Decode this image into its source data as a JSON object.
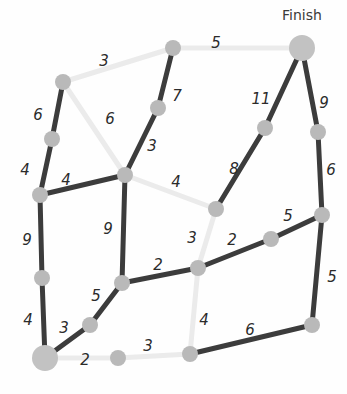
{
  "canvas": {
    "width": 347,
    "height": 394,
    "background": "#fefefe"
  },
  "style": {
    "dark_edge_color": "#3c3c3c",
    "light_edge_color": "#ebebeb",
    "node_color": "#b9b9b9",
    "terminal_node_color": "#c2c2c2",
    "label_color": "#2b2b2b",
    "edge_width": 5,
    "node_radius": 8,
    "terminal_node_radius": 13
  },
  "labels": {
    "finish": "Finish"
  },
  "chart_data": {
    "type": "diagram",
    "nodes": [
      {
        "id": "A",
        "x": 63,
        "y": 82,
        "r": 8,
        "kind": "normal"
      },
      {
        "id": "B",
        "x": 52,
        "y": 139,
        "r": 8,
        "kind": "normal"
      },
      {
        "id": "C",
        "x": 40,
        "y": 195,
        "r": 8,
        "kind": "normal"
      },
      {
        "id": "D",
        "x": 42,
        "y": 278,
        "r": 8,
        "kind": "normal"
      },
      {
        "id": "E",
        "x": 45,
        "y": 358,
        "r": 13,
        "kind": "terminal",
        "label": "Start"
      },
      {
        "id": "F",
        "x": 90,
        "y": 325,
        "r": 8,
        "kind": "normal"
      },
      {
        "id": "G",
        "x": 122,
        "y": 283,
        "r": 8,
        "kind": "normal"
      },
      {
        "id": "H",
        "x": 125,
        "y": 175,
        "r": 8,
        "kind": "normal"
      },
      {
        "id": "I",
        "x": 158,
        "y": 108,
        "r": 8,
        "kind": "normal"
      },
      {
        "id": "J",
        "x": 173,
        "y": 48,
        "r": 8,
        "kind": "normal"
      },
      {
        "id": "K",
        "x": 302,
        "y": 48,
        "r": 13,
        "kind": "terminal",
        "label": "Finish"
      },
      {
        "id": "L",
        "x": 265,
        "y": 128,
        "r": 8,
        "kind": "normal"
      },
      {
        "id": "M",
        "x": 318,
        "y": 132,
        "r": 8,
        "kind": "normal"
      },
      {
        "id": "N",
        "x": 322,
        "y": 215,
        "r": 8,
        "kind": "normal"
      },
      {
        "id": "O",
        "x": 271,
        "y": 239,
        "r": 8,
        "kind": "normal"
      },
      {
        "id": "P",
        "x": 216,
        "y": 209,
        "r": 8,
        "kind": "normal"
      },
      {
        "id": "Q",
        "x": 198,
        "y": 268,
        "r": 8,
        "kind": "normal"
      },
      {
        "id": "R",
        "x": 190,
        "y": 354,
        "r": 8,
        "kind": "normal"
      },
      {
        "id": "S",
        "x": 312,
        "y": 325,
        "r": 8,
        "kind": "normal"
      },
      {
        "id": "T",
        "x": 118,
        "y": 358,
        "r": 8,
        "kind": "normal"
      }
    ],
    "edges": [
      {
        "from": "A",
        "to": "J",
        "weight": "3",
        "highlighted": true,
        "label_x": 104,
        "label_y": 61
      },
      {
        "from": "J",
        "to": "K",
        "weight": "5",
        "highlighted": true,
        "label_x": 216,
        "label_y": 43
      },
      {
        "from": "A",
        "to": "B",
        "weight": "6",
        "highlighted": false,
        "label_x": 38,
        "label_y": 115
      },
      {
        "from": "A",
        "to": "H",
        "weight": "6",
        "highlighted": true,
        "label_x": 110,
        "label_y": 119
      },
      {
        "from": "B",
        "to": "C",
        "weight": "4",
        "highlighted": false,
        "label_x": 25,
        "label_y": 170
      },
      {
        "from": "J",
        "to": "I",
        "weight": "7",
        "highlighted": false,
        "label_x": 177,
        "label_y": 96
      },
      {
        "from": "I",
        "to": "H",
        "weight": "3",
        "highlighted": false,
        "label_x": 152,
        "label_y": 146
      },
      {
        "from": "C",
        "to": "H",
        "weight": "4",
        "highlighted": false,
        "label_x": 66,
        "label_y": 180
      },
      {
        "from": "H",
        "to": "P",
        "weight": "4",
        "highlighted": true,
        "label_x": 176,
        "label_y": 182
      },
      {
        "from": "C",
        "to": "D",
        "weight": "9",
        "highlighted": false,
        "label_x": 27,
        "label_y": 240
      },
      {
        "from": "H",
        "to": "G",
        "weight": "9",
        "highlighted": false,
        "label_x": 108,
        "label_y": 229
      },
      {
        "from": "K",
        "to": "L",
        "weight": "11",
        "highlighted": false,
        "label_x": 261,
        "label_y": 99
      },
      {
        "from": "K",
        "to": "M",
        "weight": "9",
        "highlighted": false,
        "label_x": 324,
        "label_y": 103
      },
      {
        "from": "L",
        "to": "P",
        "weight": "8",
        "highlighted": false,
        "label_x": 234,
        "label_y": 169
      },
      {
        "from": "M",
        "to": "N",
        "weight": "6",
        "highlighted": false,
        "label_x": 331,
        "label_y": 170
      },
      {
        "from": "N",
        "to": "O",
        "weight": "5",
        "highlighted": false,
        "label_x": 288,
        "label_y": 216
      },
      {
        "from": "O",
        "to": "Q",
        "weight": "2",
        "highlighted": false,
        "label_x": 232,
        "label_y": 240
      },
      {
        "from": "P",
        "to": "Q",
        "weight": "3",
        "highlighted": true,
        "label_x": 192,
        "label_y": 238
      },
      {
        "from": "G",
        "to": "Q",
        "weight": "2",
        "highlighted": false,
        "label_x": 158,
        "label_y": 265
      },
      {
        "from": "N",
        "to": "S",
        "weight": "5",
        "highlighted": false,
        "label_x": 332,
        "label_y": 277
      },
      {
        "from": "G",
        "to": "F",
        "weight": "5",
        "highlighted": false,
        "label_x": 96,
        "label_y": 296
      },
      {
        "from": "D",
        "to": "E",
        "weight": "4",
        "highlighted": false,
        "label_x": 28,
        "label_y": 320
      },
      {
        "from": "E",
        "to": "F",
        "weight": "3",
        "highlighted": false,
        "label_x": 64,
        "label_y": 328
      },
      {
        "from": "E",
        "to": "T",
        "weight": "2",
        "highlighted": true,
        "label_x": 85,
        "label_y": 360
      },
      {
        "from": "T",
        "to": "R",
        "weight": "3",
        "highlighted": true,
        "label_x": 148,
        "label_y": 346
      },
      {
        "from": "Q",
        "to": "R",
        "weight": "4",
        "highlighted": true,
        "label_x": 204,
        "label_y": 320
      },
      {
        "from": "R",
        "to": "S",
        "weight": "6",
        "highlighted": false,
        "label_x": 250,
        "label_y": 330
      }
    ],
    "highlighted_path": [
      "E",
      "T",
      "R",
      "Q",
      "P",
      "H",
      "A",
      "J",
      "K"
    ],
    "highlighted_path_weights": [
      "2",
      "3",
      "4",
      "3",
      "4",
      "6",
      "3",
      "5"
    ]
  }
}
